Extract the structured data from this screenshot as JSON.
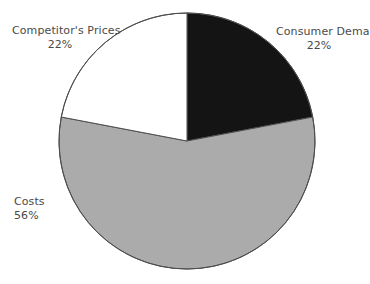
{
  "chart_data": {
    "type": "pie",
    "title": "",
    "subtitle": "",
    "xlabel": "",
    "ylabel": "",
    "legend_position": "none",
    "grid": false,
    "start_angle_deg": 0,
    "direction": "clockwise",
    "total_percent": 100,
    "categories": [
      "Consumer Demand",
      "Costs",
      "Competitor's Prices"
    ],
    "values": [
      22,
      56,
      22
    ],
    "slices": [
      {
        "label": "Consumer Demand",
        "value": 22,
        "value_text": "22%",
        "color": "#141414",
        "label_position": "upper-right"
      },
      {
        "label": "Costs",
        "value": 56,
        "value_text": "56%",
        "color": "#ababab",
        "label_position": "middle-left"
      },
      {
        "label": "Competitor's Prices",
        "value": 22,
        "value_text": "22%",
        "color": "#ffffff",
        "label_position": "upper-left"
      }
    ]
  },
  "geometry": {
    "center_x": 187,
    "center_y": 141,
    "radius": 128,
    "outline_color": "#4d4d4d",
    "outline_width": 1,
    "background": "#ffffff"
  },
  "labels": {
    "competitors_prices": {
      "name": "Competitor's Prices",
      "value": "22%"
    },
    "consumer_demand": {
      "name": "Consumer Demand",
      "value": "22%"
    },
    "costs": {
      "name": "Costs",
      "value": "56%"
    }
  }
}
